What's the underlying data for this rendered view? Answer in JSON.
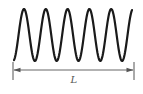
{
  "diagram": {
    "type": "sine-wave-with-length-dimension",
    "wave": {
      "color": "#1a1a1a",
      "stroke_width": 2.2,
      "x_start": 14,
      "x_end": 132,
      "center_y": 35,
      "amplitude": 26,
      "period": 21.8,
      "peaks_x": [
        24,
        46,
        68,
        90,
        111
      ],
      "troughs_x": [
        35,
        57,
        79,
        100,
        122
      ]
    },
    "dimension": {
      "color": "#555555",
      "left_x": 13,
      "right_x": 134,
      "line_y": 70,
      "tick_top": 62,
      "tick_bottom": 80,
      "label": "L"
    }
  }
}
